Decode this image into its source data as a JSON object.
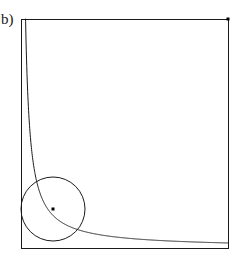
{
  "figure": {
    "panel_label": "b)",
    "clipped_top_glyph": "g",
    "background_color": "#ffffff",
    "stroke_color": "#1a1a1a",
    "marker_color": "#000000"
  },
  "chart_data": {
    "type": "line",
    "title": "",
    "subtitle": "",
    "xlabel": "",
    "ylabel": "",
    "grid": false,
    "legend": null,
    "xlim": [
      0,
      1
    ],
    "ylim": [
      0,
      1
    ],
    "frame": {
      "name": "unit-square-frame",
      "x0_px": 21,
      "y0_px": 19,
      "x1_px": 228,
      "y1_px": 248,
      "stroke_width_px": 1
    },
    "series": [
      {
        "name": "hyperbola-curve",
        "kind": "curve",
        "equation": "y = k / x",
        "k": 0.022,
        "x": [
          0.01,
          0.02,
          0.03,
          0.04,
          0.05,
          0.06,
          0.07,
          0.08,
          0.09,
          0.1,
          0.12,
          0.14,
          0.16,
          0.18,
          0.2,
          0.23,
          0.26,
          0.3,
          0.34,
          0.38,
          0.42,
          0.46,
          0.5,
          0.55,
          0.6,
          0.65,
          0.7,
          0.75,
          0.8,
          0.85,
          0.9,
          0.95,
          1.0
        ],
        "y": [
          1.0,
          1.0,
          0.733,
          0.55,
          0.44,
          0.367,
          0.314,
          0.275,
          0.244,
          0.22,
          0.183,
          0.157,
          0.138,
          0.122,
          0.11,
          0.096,
          0.085,
          0.073,
          0.065,
          0.058,
          0.052,
          0.048,
          0.044,
          0.04,
          0.037,
          0.034,
          0.031,
          0.029,
          0.028,
          0.026,
          0.024,
          0.023,
          0.022
        ]
      },
      {
        "name": "inscribed-circle",
        "kind": "circle",
        "center_x": 0.155,
        "center_y": 0.17,
        "radius": 0.155,
        "center_px": [
          53,
          209
        ],
        "radius_px": 32,
        "tangent_to": [
          "left-edge",
          "bottom-edge",
          "hyperbola-curve"
        ]
      }
    ],
    "markers": [
      {
        "name": "circle-center-point",
        "x": 0.155,
        "y": 0.17,
        "px": [
          53,
          209
        ],
        "size_px": 3,
        "shape": "square",
        "filled": true
      },
      {
        "name": "top-right-corner-point",
        "x": 1.0,
        "y": 1.0,
        "px": [
          228,
          19
        ],
        "size_px": 3,
        "shape": "square",
        "filled": true
      }
    ],
    "annotations": [
      {
        "name": "panel-label",
        "text": "b)",
        "px": [
          3,
          20
        ]
      }
    ]
  }
}
